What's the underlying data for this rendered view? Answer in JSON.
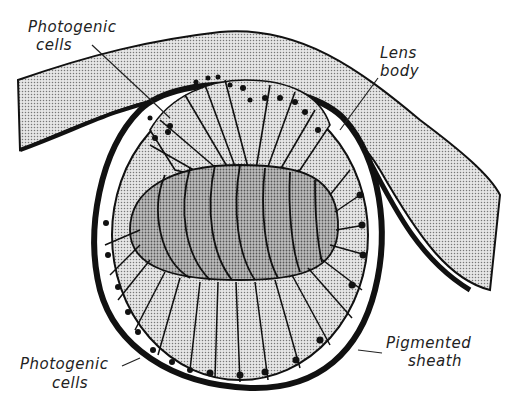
{
  "figure": {
    "labels": {
      "photogenic_top": {
        "line1": "Photogenic",
        "line2": "cells"
      },
      "lens_body": {
        "line1": "Lens",
        "line2": "body"
      },
      "photogenic_bottom": {
        "line1": "Photogenic",
        "line2": "cells"
      },
      "pigmented_sheath": {
        "line1": "Pigmented",
        "line2": "sheath"
      }
    },
    "colors": {
      "ink": "#111111",
      "stipple_light": "#d9d9d9",
      "stipple_dark": "#a8a8a8",
      "background": "#ffffff"
    }
  }
}
